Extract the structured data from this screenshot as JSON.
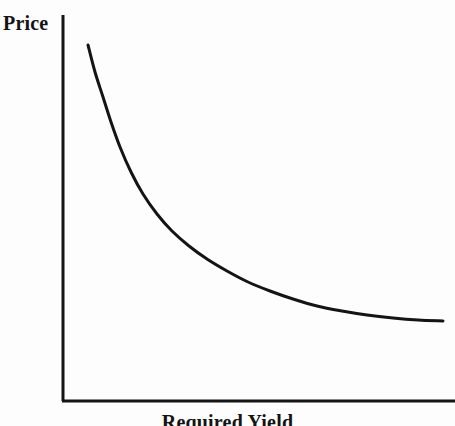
{
  "figure": {
    "background_color": "#fdfdfd",
    "ink_color": "#141414"
  },
  "axes": {
    "y_label": "Price",
    "x_label": "Required Yield",
    "y_axis_name": "price-axis",
    "x_axis_name": "required-yield-axis",
    "origin_px": [
      63,
      401
    ],
    "y_axis_top_px": [
      63,
      15
    ],
    "x_axis_right_px": [
      455,
      401
    ],
    "line_width_px": 3,
    "ticks": [],
    "tick_labels": [],
    "grid": false
  },
  "chart_data": {
    "type": "line",
    "xlabel": "Required Yield",
    "ylabel": "Price",
    "grid": false,
    "legend": null,
    "axis_tick_labels": {
      "x": [],
      "y": []
    },
    "xlim": [
      0,
      1
    ],
    "ylim": [
      0,
      1
    ],
    "series": [
      {
        "name": "price-curve",
        "shape": "convex decreasing (inverse / hyperbolic)",
        "color": "#141414",
        "line_width": 3,
        "points_px": [
          [
            88,
            45
          ],
          [
            95,
            72
          ],
          [
            103,
            97
          ],
          [
            111,
            122
          ],
          [
            120,
            147
          ],
          [
            131,
            172
          ],
          [
            143,
            194
          ],
          [
            157,
            214
          ],
          [
            172,
            231
          ],
          [
            189,
            246
          ],
          [
            207,
            259
          ],
          [
            227,
            271
          ],
          [
            248,
            282
          ],
          [
            270,
            291
          ],
          [
            293,
            299
          ],
          [
            317,
            306
          ],
          [
            342,
            311
          ],
          [
            367,
            315
          ],
          [
            393,
            318
          ],
          [
            418,
            320
          ],
          [
            443,
            321
          ]
        ],
        "x_normalized": [
          0.064,
          0.082,
          0.102,
          0.122,
          0.145,
          0.173,
          0.204,
          0.24,
          0.278,
          0.321,
          0.367,
          0.418,
          0.472,
          0.528,
          0.587,
          0.648,
          0.712,
          0.776,
          0.842,
          0.906,
          0.969
        ],
        "y_normalized": [
          0.922,
          0.852,
          0.786,
          0.722,
          0.658,
          0.593,
          0.536,
          0.484,
          0.44,
          0.401,
          0.367,
          0.336,
          0.308,
          0.285,
          0.264,
          0.246,
          0.233,
          0.223,
          0.215,
          0.21,
          0.207
        ]
      }
    ],
    "annotations": []
  }
}
